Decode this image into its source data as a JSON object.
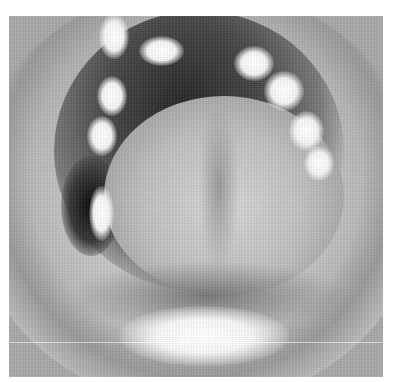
{
  "image": {
    "description": "Grayscale intraoral photograph of an open mouth showing tongue, upper teeth and lips",
    "alt": "Grayscale photo of open mouth"
  }
}
